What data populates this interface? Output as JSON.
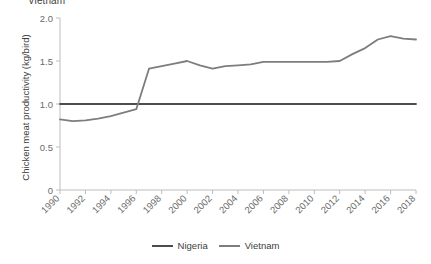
{
  "clipped_title": "Vietnam",
  "chart_data": {
    "type": "line",
    "title": "Vietnam",
    "xlabel": "",
    "ylabel": "Chicken meat productivity (kg/bird)",
    "xlim": [
      1990,
      2018
    ],
    "ylim": [
      0,
      2.0
    ],
    "grid": false,
    "legend_position": "bottom",
    "x": [
      1990,
      1991,
      1992,
      1993,
      1994,
      1995,
      1996,
      1997,
      1998,
      1999,
      2000,
      2001,
      2002,
      2003,
      2004,
      2005,
      2006,
      2007,
      2008,
      2009,
      2010,
      2011,
      2012,
      2013,
      2014,
      2015,
      2016,
      2017,
      2018
    ],
    "ytick_labels": [
      "0",
      "0.5",
      "1.0",
      "1.5",
      "2.0"
    ],
    "ytick_values": [
      0,
      0.5,
      1.0,
      1.5,
      2.0
    ],
    "xtick_labels": [
      "1990",
      "1992",
      "1994",
      "1996",
      "1998",
      "2000",
      "2002",
      "2004",
      "2006",
      "2008",
      "2010",
      "2012",
      "2014",
      "2016",
      "2018"
    ],
    "xtick_values": [
      1990,
      1992,
      1994,
      1996,
      1998,
      2000,
      2002,
      2004,
      2006,
      2008,
      2010,
      2012,
      2014,
      2016,
      2018
    ],
    "series": [
      {
        "name": "Nigeria",
        "color": "#4d4d4d",
        "values": [
          1.0,
          1.0,
          1.0,
          1.0,
          1.0,
          1.0,
          1.0,
          1.0,
          1.0,
          1.0,
          1.0,
          1.0,
          1.0,
          1.0,
          1.0,
          1.0,
          1.0,
          1.0,
          1.0,
          1.0,
          1.0,
          1.0,
          1.0,
          1.0,
          1.0,
          1.0,
          1.0,
          1.0,
          1.0
        ]
      },
      {
        "name": "Vietnam",
        "color": "#7d7d7d",
        "values": [
          0.82,
          0.8,
          0.81,
          0.83,
          0.86,
          0.9,
          0.94,
          1.41,
          1.44,
          1.47,
          1.5,
          1.45,
          1.41,
          1.44,
          1.45,
          1.46,
          1.49,
          1.49,
          1.49,
          1.49,
          1.49,
          1.49,
          1.5,
          1.58,
          1.65,
          1.75,
          1.79,
          1.76,
          1.75
        ]
      }
    ]
  },
  "axis": {
    "line_color": "#bdbdbd"
  },
  "legend": {
    "entries": [
      {
        "label": "Nigeria",
        "color": "#4d4d4d"
      },
      {
        "label": "Vietnam",
        "color": "#7d7d7d"
      }
    ]
  }
}
